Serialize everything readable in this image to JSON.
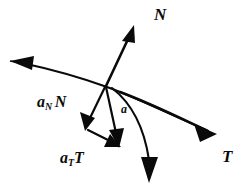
{
  "figure": {
    "kind": "vector-diagram",
    "background_color": "#ffffff",
    "ink_color": "#0a0a0a",
    "width": 246,
    "height": 191
  },
  "labels": {
    "normal_unit_vector": "N",
    "tangent_unit_vector": "T",
    "acceleration": "a",
    "normal_component_base": "a",
    "normal_component_sub": "N",
    "normal_component_vector": "N",
    "tangential_component_base": "a",
    "tangential_component_sub": "T",
    "tangential_component_vector": "T"
  },
  "geometry": {
    "origin": {
      "x": 105,
      "y": 85
    },
    "vectors": [
      {
        "name": "N",
        "from": [
          105,
          85
        ],
        "to": [
          133,
          26
        ]
      },
      {
        "name": "T",
        "from": [
          105,
          85
        ],
        "to": [
          215,
          133
        ]
      },
      {
        "name": "a",
        "from": [
          105,
          85
        ],
        "to": [
          118,
          146
        ]
      },
      {
        "name": "aN_N",
        "from": [
          105,
          85
        ],
        "to": [
          86,
          130
        ]
      },
      {
        "name": "aT_T",
        "from": [
          86,
          130
        ],
        "to": [
          118,
          146
        ]
      }
    ],
    "curves": [
      {
        "name": "trajectory",
        "from": [
          12,
          62
        ],
        "to": [
          215,
          133
        ],
        "arrow_at": "start"
      },
      {
        "name": "descending-branch",
        "from": [
          113,
          88
        ],
        "to": [
          150,
          181
        ],
        "arrow_at": "end"
      }
    ]
  }
}
